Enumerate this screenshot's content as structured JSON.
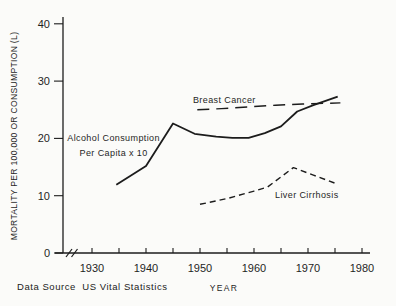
{
  "figure": {
    "data_source_note": "Data Source  US Vital Statistics"
  },
  "chart_data": {
    "type": "line",
    "title": "",
    "xlabel": "YEAR",
    "ylabel": "MORTALITY PER 100,000 OR CONSUMPTION (L)",
    "xlim": [
      1924,
      1981
    ],
    "ylim": [
      0,
      40
    ],
    "grid": false,
    "legend_position": "inline-annotations",
    "line_color": "#1c1c1c",
    "axis_break_at_origin": true,
    "x_major_ticks": [
      {
        "value": 1930,
        "label": "1930"
      },
      {
        "value": 1940,
        "label": "1940"
      },
      {
        "value": 1950,
        "label": "1950"
      },
      {
        "value": 1960,
        "label": "1960"
      },
      {
        "value": 1970,
        "label": "1970"
      },
      {
        "value": 1980,
        "label": "1980"
      }
    ],
    "x_minor_ticks": [
      1935,
      1945,
      1955,
      1965,
      1975
    ],
    "y_ticks": [
      {
        "value": 0,
        "label": "0"
      },
      {
        "value": 10,
        "label": "10"
      },
      {
        "value": 20,
        "label": "20"
      },
      {
        "value": 30,
        "label": "30"
      },
      {
        "value": 40,
        "label": "40"
      }
    ],
    "series": [
      {
        "name": "Alcohol Consumption Per Capita x 10",
        "line_style": "solid",
        "points": [
          [
            1934.5,
            11.9
          ],
          [
            1937,
            13.4
          ],
          [
            1940,
            15.2
          ],
          [
            1945,
            22.6
          ],
          [
            1949,
            20.8
          ],
          [
            1953,
            20.3
          ],
          [
            1956,
            20.1
          ],
          [
            1959,
            20.1
          ],
          [
            1962,
            20.9
          ],
          [
            1965,
            22.1
          ],
          [
            1968,
            24.7
          ],
          [
            1971,
            25.8
          ],
          [
            1975.5,
            27.3
          ]
        ]
      },
      {
        "name": "Breast Cancer",
        "line_style": "long-dash",
        "points": [
          [
            1949.5,
            25.0
          ],
          [
            1954,
            25.2
          ],
          [
            1959,
            25.5
          ],
          [
            1964,
            25.8
          ],
          [
            1969,
            26.0
          ],
          [
            1976,
            26.2
          ]
        ]
      },
      {
        "name": "Liver Cirrhosis",
        "line_style": "short-dash",
        "points": [
          [
            1950,
            8.5
          ],
          [
            1955,
            9.5
          ],
          [
            1960,
            10.8
          ],
          [
            1962.5,
            11.5
          ],
          [
            1967.3,
            14.9
          ],
          [
            1971,
            13.6
          ],
          [
            1975.5,
            12.0
          ]
        ]
      }
    ],
    "annotations": [
      {
        "text": [
          "Alcohol Consumption",
          "Per Capita x 10"
        ],
        "x": 1934,
        "y": 19.6,
        "anchor": "middle"
      },
      {
        "text": [
          "Breast Cancer"
        ],
        "x": 1948.7,
        "y": 26.2,
        "anchor": "start"
      },
      {
        "text": [
          "Liver Cirrhosis"
        ],
        "x": 1963.9,
        "y": 9.6,
        "anchor": "start"
      }
    ]
  }
}
